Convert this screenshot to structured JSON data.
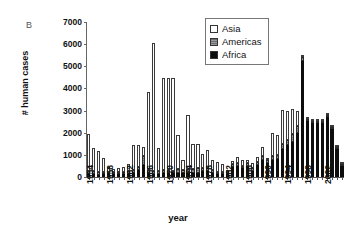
{
  "panel": {
    "label": "B"
  },
  "chart_data": {
    "type": "bar",
    "stacked": true,
    "title": "",
    "xlabel": "year",
    "ylabel": "# human cases",
    "ylim": [
      0,
      7000
    ],
    "ytick_step": 1000,
    "yticks": [
      "0",
      "1000",
      "2000",
      "3000",
      "4000",
      "5000",
      "6000",
      "7000"
    ],
    "grid": false,
    "legend_position": "top-right",
    "legend": [
      {
        "name": "Asia",
        "color": "#ffffff",
        "swatch": "white-open"
      },
      {
        "name": "Americas",
        "color": "#6e6e6e",
        "swatch": "gray-hatched"
      },
      {
        "name": "Africa",
        "color": "#0d0d0d",
        "swatch": "black-solid"
      }
    ],
    "categories": [
      "1954",
      "1955",
      "1956",
      "1957",
      "1958",
      "1959",
      "1960",
      "1961",
      "1962",
      "1963",
      "1964",
      "1965",
      "1966",
      "1967",
      "1968",
      "1969",
      "1970",
      "1971",
      "1972",
      "1973",
      "1974",
      "1975",
      "1976",
      "1977",
      "1978",
      "1979",
      "1980",
      "1981",
      "1982",
      "1983",
      "1984",
      "1985",
      "1986",
      "1987",
      "1988",
      "1989",
      "1990",
      "1991",
      "1992",
      "1993",
      "1994",
      "1995",
      "1996",
      "1997",
      "1998",
      "1999",
      "2000",
      "2001",
      "2002",
      "2003",
      "2004",
      "2005"
    ],
    "xtick_labels": [
      "1954",
      "1958",
      "1962",
      "1966",
      "1970",
      "1974",
      "1978",
      "1982",
      "1986",
      "1990",
      "1994",
      "1998",
      "2002"
    ],
    "xtick_every": 4,
    "series": [
      {
        "name": "Africa",
        "values": [
          120,
          120,
          110,
          120,
          130,
          120,
          120,
          130,
          140,
          200,
          300,
          550,
          160,
          150,
          150,
          160,
          170,
          160,
          200,
          180,
          200,
          190,
          200,
          260,
          280,
          200,
          150,
          150,
          130,
          450,
          500,
          400,
          520,
          280,
          560,
          760,
          620,
          780,
          830,
          1270,
          1430,
          1560,
          2000,
          5250,
          2540,
          2430,
          2430,
          2430,
          2700,
          2180,
          1250,
          500
        ]
      },
      {
        "name": "Americas",
        "values": [
          140,
          150,
          130,
          120,
          110,
          110,
          100,
          110,
          120,
          120,
          160,
          380,
          150,
          130,
          130,
          140,
          140,
          130,
          140,
          130,
          180,
          170,
          200,
          170,
          130,
          110,
          70,
          60,
          50,
          150,
          150,
          120,
          120,
          150,
          130,
          170,
          170,
          180,
          180,
          210,
          260,
          380,
          320,
          180,
          100,
          110,
          120,
          110,
          110,
          80,
          60,
          40
        ]
      },
      {
        "name": "Asia",
        "values": [
          1690,
          1050,
          950,
          600,
          230,
          140,
          180,
          200,
          320,
          1120,
          980,
          430,
          3520,
          5770,
          1040,
          4190,
          4160,
          4160,
          1540,
          450,
          2430,
          1140,
          1110,
          610,
          830,
          470,
          430,
          340,
          110,
          140,
          260,
          240,
          140,
          190,
          210,
          410,
          60,
          1050,
          870,
          1550,
          1310,
          1110,
          680,
          80,
          60,
          50,
          40,
          30,
          30,
          20,
          20,
          10
        ]
      }
    ],
    "totals": [
      1950,
      1320,
      1190,
      840,
      470,
      370,
      400,
      440,
      580,
      1440,
      1440,
      1360,
      3830,
      6050,
      1320,
      4490,
      4470,
      4450,
      1880,
      760,
      2810,
      1500,
      1510,
      1040,
      1240,
      780,
      650,
      550,
      290,
      740,
      910,
      760,
      780,
      620,
      900,
      1340,
      850,
      2010,
      1880,
      3030,
      3000,
      3050,
      3000,
      5510,
      2700,
      2590,
      2590,
      2570,
      2840,
      2280,
      1330,
      550
    ],
    "annotations": [
      {
        "text": "Peak driven by Asia in 1967",
        "value": 6050,
        "category": "1967"
      },
      {
        "text": "Peak driven by Africa in 1997",
        "value": 5510,
        "category": "1997"
      }
    ]
  }
}
